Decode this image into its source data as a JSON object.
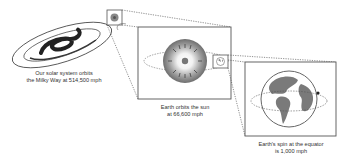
{
  "diagram": {
    "panels": [
      {
        "id": "milky-way",
        "caption_line1": "Our solar system orbits",
        "caption_line2": "the Milky Way at 514,500 mph",
        "speed_mph": 514500
      },
      {
        "id": "sun-orbit",
        "caption_line1": "Earth orbits the sun",
        "caption_line2": "at 66,600 mph",
        "speed_mph": 66600
      },
      {
        "id": "earth-spin",
        "caption_line1": "Earth's spin at the equator",
        "caption_line2": "is 1,000 mph",
        "speed_mph": 1000
      }
    ],
    "colors": {
      "ink": "#333333",
      "box": "#555555",
      "earth_land": "#7a7a7a",
      "sun": "#8a8a8a"
    }
  }
}
